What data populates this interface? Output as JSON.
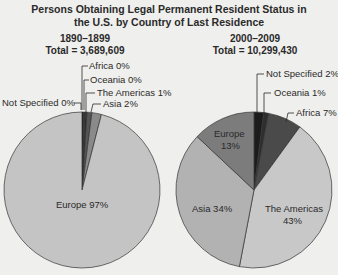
{
  "title_line1": "Persons Obtaining Legal Permanent Resident Status in",
  "title_line2": "the U.S. by Country of Last Residence",
  "chart_data": [
    {
      "type": "pie",
      "title": "Persons Obtaining Legal Permanent Resident Status in the U.S. by Country of Last Residence",
      "subtitle": "1890–1899",
      "total_label": "Total = 3,689,609",
      "total": 3689609,
      "start": "12 o'clock, clockwise",
      "slices": [
        {
          "name": "Not Specified",
          "value": 0,
          "label": "Not Specified 0%",
          "color": "#1a1a1a"
        },
        {
          "name": "Africa",
          "value": 0,
          "label": "Africa 0%",
          "color": "#3a3a3a"
        },
        {
          "name": "Oceania",
          "value": 0,
          "label": "Oceania 0%",
          "color": "#2a2a2a"
        },
        {
          "name": "The Americas",
          "value": 1,
          "label": "The Americas 1%",
          "color": "#555555"
        },
        {
          "name": "Asia",
          "value": 2,
          "label": "Asia 2%",
          "color": "#8a8a8a"
        },
        {
          "name": "Europe",
          "value": 97,
          "label": "Europe 97%",
          "color": "#c4c4c4"
        }
      ]
    },
    {
      "type": "pie",
      "subtitle": "2000–2009",
      "total_label": "Total = 10,299,430",
      "total": 10299430,
      "start": "12 o'clock, clockwise",
      "slices": [
        {
          "name": "Not Specified",
          "value": 2,
          "label": "Not Specified 2%",
          "color": "#1c1c1c"
        },
        {
          "name": "Oceania",
          "value": 1,
          "label": "Oceania 1%",
          "color": "#2e2e2e"
        },
        {
          "name": "Africa",
          "value": 7,
          "label": "Africa 7%",
          "color": "#4a4a4a"
        },
        {
          "name": "The Americas",
          "value": 43,
          "label": "The Americas 43%",
          "color": "#c8c8c8"
        },
        {
          "name": "Asia",
          "value": 34,
          "label": "Asia 34%",
          "color": "#b2b2b2"
        },
        {
          "name": "Europe",
          "value": 13,
          "label": "Europe 13%",
          "color": "#7c7c7c"
        }
      ]
    }
  ],
  "left": {
    "period": "1890–1899",
    "total": "Total = 3,689,609"
  },
  "right": {
    "period": "2000–2009",
    "total": "Total = 10,299,430"
  },
  "labels": {
    "l_africa": "Africa 0%",
    "l_oceania": "Oceania 0%",
    "l_americas": "The Americas 1%",
    "l_notspec": "Not Specified 0%",
    "l_asia": "Asia 2%",
    "l_europe": "Europe 97%",
    "r_notspec": "Not Specified 2%",
    "r_oceania": "Oceania 1%",
    "r_africa": "Africa 7%",
    "r_europe_1": "Europe",
    "r_europe_2": "13%",
    "r_asia": "Asia 34%",
    "r_americas_1": "The Americas",
    "r_americas_2": "43%"
  }
}
